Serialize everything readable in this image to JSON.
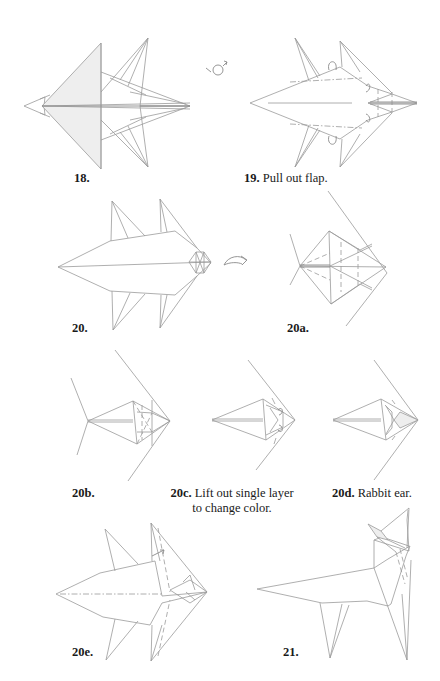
{
  "page": {
    "type": "origami diagram page",
    "background": "#ffffff",
    "line_color": "#9a9a9a",
    "shade_color": "#eeeeee"
  },
  "steps": [
    {
      "id": "18",
      "number": "18.",
      "instruction": "",
      "symbol": ""
    },
    {
      "id": "19",
      "number": "19.",
      "instruction": "Pull out flap.",
      "symbol": "turn-over-icon"
    },
    {
      "id": "20",
      "number": "20.",
      "instruction": "",
      "symbol": ""
    },
    {
      "id": "20a",
      "number": "20a.",
      "instruction": "",
      "symbol": "rotate-arrow-icon"
    },
    {
      "id": "20b",
      "number": "20b.",
      "instruction": "",
      "symbol": ""
    },
    {
      "id": "20c",
      "number": "20c.",
      "instruction_line1": "Lift out single layer",
      "instruction_line2": "to change color.",
      "symbol": ""
    },
    {
      "id": "20d",
      "number": "20d.",
      "instruction": "Rabbit ear.",
      "symbol": ""
    },
    {
      "id": "20e",
      "number": "20e.",
      "instruction": "",
      "symbol": ""
    },
    {
      "id": "21",
      "number": "21.",
      "instruction": "",
      "symbol": ""
    }
  ]
}
